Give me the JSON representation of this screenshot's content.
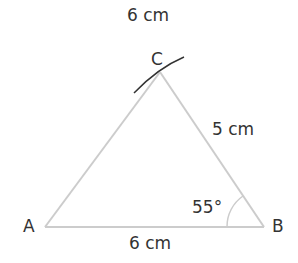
{
  "diagram": {
    "title": "6 cm",
    "vertices": {
      "A": {
        "label": "A"
      },
      "B": {
        "label": "B"
      },
      "C": {
        "label": "C"
      }
    },
    "sides": {
      "AB": {
        "label": "6 cm"
      },
      "BC": {
        "label": "5 cm"
      }
    },
    "angle_B": {
      "label": "55°"
    },
    "colors": {
      "side": "#cccccc",
      "arc_mark": "#333333",
      "text": "#333333"
    }
  }
}
